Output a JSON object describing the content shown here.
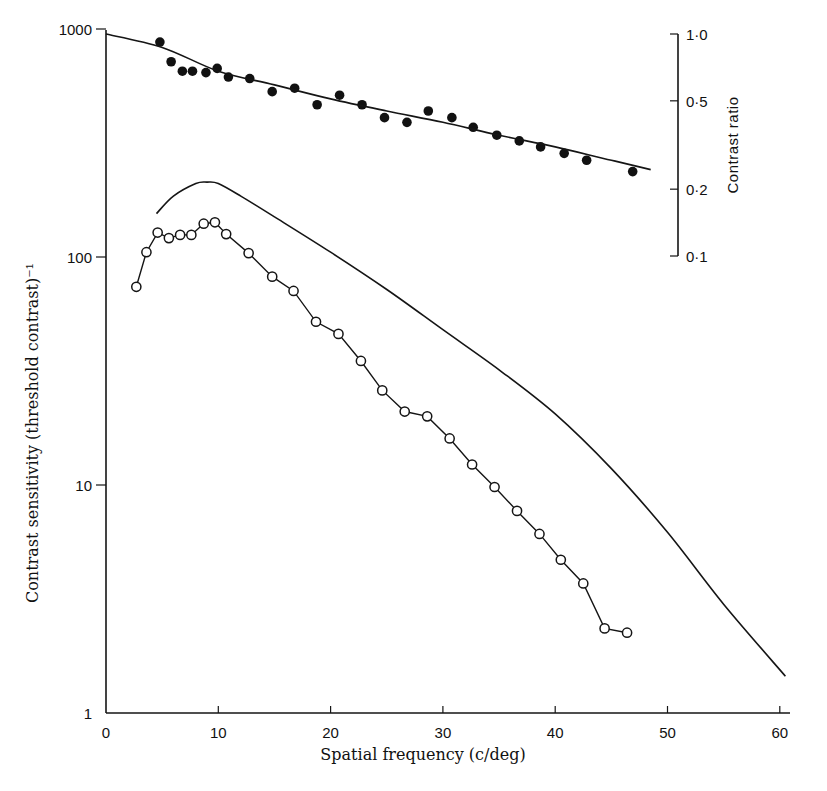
{
  "chart_data": {
    "type": "line",
    "title": "",
    "xlabel": "Spatial frequency (c/deg)",
    "ylabel": "Contrast sensitivity (threshold contrast)⁻¹",
    "y2label": "Contrast ratio",
    "xlim": [
      0,
      62
    ],
    "ylim": [
      1,
      1000
    ],
    "yscale": "log",
    "y2lim": [
      0.1,
      1.0
    ],
    "y2scale": "log",
    "x_ticks": [
      0,
      10,
      20,
      30,
      40,
      50,
      60
    ],
    "y_ticks": [
      1,
      10,
      100,
      1000
    ],
    "y2_ticks": [
      "0·1",
      "0·2",
      "0·5",
      "1·0"
    ],
    "grid": false,
    "legend": null,
    "series": [
      {
        "name": "Measured contrast sensitivity (open circles)",
        "marker": "open-circle",
        "axis": "left",
        "x": [
          2.7,
          3.6,
          4.6,
          5.6,
          6.6,
          7.6,
          8.7,
          9.7,
          10.7,
          12.7,
          14.8,
          16.7,
          18.7,
          20.7,
          22.7,
          24.6,
          26.6,
          28.6,
          30.6,
          32.6,
          34.6,
          36.6,
          38.6,
          40.5,
          42.5,
          44.4,
          46.4
        ],
        "y": [
          74,
          105,
          128,
          121,
          125,
          125,
          140,
          142,
          126,
          104,
          82,
          71,
          52,
          46,
          35,
          26,
          21,
          20,
          16,
          12.3,
          9.8,
          7.7,
          6.1,
          4.7,
          3.7,
          2.35,
          2.25
        ]
      },
      {
        "name": "Smooth envelope curve (solid line)",
        "marker": "none",
        "axis": "left",
        "x": [
          4.5,
          6,
          8,
          9,
          10,
          12,
          15,
          20,
          25,
          30,
          35,
          40,
          45,
          50,
          55,
          60.5
        ],
        "y": [
          155,
          185,
          210,
          213,
          210,
          185,
          150,
          105,
          72,
          48,
          32,
          20.5,
          11.8,
          6.2,
          3.0,
          1.45
        ]
      },
      {
        "name": "Contrast ratio (filled circles)",
        "marker": "filled-circle",
        "axis": "right",
        "x": [
          4.8,
          5.8,
          6.8,
          7.7,
          8.9,
          9.9,
          10.9,
          12.8,
          14.8,
          16.8,
          18.8,
          20.8,
          22.8,
          24.8,
          26.8,
          28.7,
          30.8,
          32.7,
          34.8,
          36.8,
          38.7,
          40.8,
          42.8,
          46.9
        ],
        "y": [
          0.92,
          0.75,
          0.68,
          0.68,
          0.67,
          0.7,
          0.64,
          0.63,
          0.55,
          0.57,
          0.48,
          0.53,
          0.48,
          0.42,
          0.4,
          0.45,
          0.42,
          0.38,
          0.35,
          0.33,
          0.31,
          0.29,
          0.27,
          0.24
        ]
      },
      {
        "name": "Contrast ratio fit (line)",
        "marker": "none",
        "axis": "right",
        "x": [
          0,
          5,
          10,
          15,
          20,
          25,
          30,
          35,
          40,
          45,
          48.5
        ],
        "y": [
          1.0,
          0.87,
          0.68,
          0.59,
          0.51,
          0.45,
          0.4,
          0.35,
          0.31,
          0.27,
          0.245
        ]
      }
    ]
  },
  "labels": {
    "x_ticks": [
      "0",
      "10",
      "20",
      "30",
      "40",
      "50",
      "60"
    ],
    "y_ticks": [
      "1",
      "10",
      "100",
      "1000"
    ],
    "y2_ticks": [
      "0·1",
      "0·2",
      "0·5",
      "1·0"
    ],
    "xlabel": "Spatial frequency (c/deg)",
    "ylabel": "Contrast sensitivity (threshold contrast)⁻¹",
    "y2label": "Contrast ratio"
  }
}
